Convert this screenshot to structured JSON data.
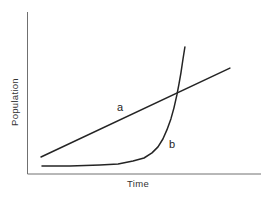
{
  "figure": {
    "ylabel": "Population",
    "xlabel": "Time",
    "background": "#ffffff",
    "axis_color": "#707070",
    "series_color": "#242424",
    "label_color": "#333333"
  },
  "chart_data": {
    "type": "line",
    "title": "",
    "xlabel": "Time",
    "ylabel": "Population",
    "legend": "none",
    "grid": false,
    "axis_ticks": "none",
    "xlim": [
      0,
      1
    ],
    "ylim": [
      0,
      1
    ],
    "series": [
      {
        "name": "a",
        "label": "a",
        "shape": "straight-line",
        "x": [
          0.058,
          0.867
        ],
        "y": [
          0.105,
          0.654
        ],
        "label_pos": {
          "x": 0.396,
          "y": 0.414
        }
      },
      {
        "name": "b",
        "label": "b",
        "shape": "exponential-curve",
        "x": [
          0.062,
          0.182,
          0.31,
          0.388,
          0.452,
          0.499,
          0.533,
          0.559,
          0.58,
          0.597,
          0.614,
          0.627,
          0.64,
          0.649,
          0.657,
          0.666,
          0.674
        ],
        "y": [
          0.049,
          0.049,
          0.056,
          0.062,
          0.08,
          0.099,
          0.13,
          0.167,
          0.216,
          0.272,
          0.34,
          0.407,
          0.488,
          0.556,
          0.623,
          0.71,
          0.784
        ],
        "label_pos": {
          "x": 0.619,
          "y": 0.185
        }
      }
    ]
  }
}
